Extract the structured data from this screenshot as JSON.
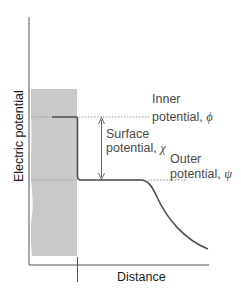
{
  "figure": {
    "type": "potential-profile-diagram",
    "axes": {
      "y_label": "Electric potential",
      "x_label": "Distance"
    },
    "labels": {
      "inner": {
        "line1": "Inner",
        "line2": "potential, ",
        "symbol": "ϕ"
      },
      "surface": {
        "line1": "Surface",
        "line2": "potential, ",
        "symbol": "χ"
      },
      "outer": {
        "line1": "Outer",
        "line2": "potential, ",
        "symbol": "ψ"
      }
    },
    "colors": {
      "phase_region": "#c9c9c9",
      "axis": "#555555",
      "curve": "#4d4d4d",
      "dotted": "#9a9a9a",
      "arrow": "#666666",
      "label_text": "#4a4a4a"
    }
  }
}
